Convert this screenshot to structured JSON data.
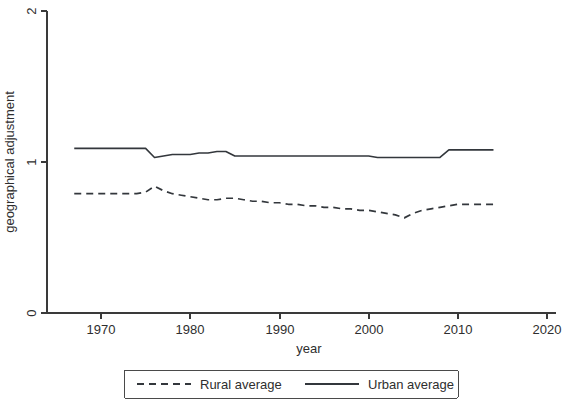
{
  "chart_data": {
    "type": "line",
    "title": "",
    "subtitle": "",
    "xlabel": "year",
    "ylabel": "geographical adjustment",
    "xlim": [
      1965,
      2020
    ],
    "ylim": [
      0,
      2
    ],
    "xticks": [
      1970,
      1980,
      1990,
      2000,
      2010,
      2020
    ],
    "xtick_labels": [
      "1970",
      "1980",
      "1990",
      "2000",
      "2010",
      "2020"
    ],
    "yticks": [
      0,
      1,
      2
    ],
    "ytick_labels": [
      "0",
      "1",
      "2"
    ],
    "grid": false,
    "legend_position": "bottom-center",
    "x": [
      1967,
      1968,
      1969,
      1970,
      1971,
      1972,
      1973,
      1974,
      1975,
      1976,
      1977,
      1978,
      1979,
      1980,
      1981,
      1982,
      1983,
      1984,
      1985,
      1986,
      1987,
      1988,
      1989,
      1990,
      1991,
      1992,
      1993,
      1994,
      1995,
      1996,
      1997,
      1998,
      1999,
      2000,
      2001,
      2002,
      2003,
      2004,
      2005,
      2006,
      2007,
      2008,
      2009,
      2010,
      2011,
      2012,
      2013,
      2014
    ],
    "series": [
      {
        "name": "Rural average",
        "style": "dashed",
        "color": "#33373c",
        "values": [
          0.79,
          0.79,
          0.79,
          0.79,
          0.79,
          0.79,
          0.79,
          0.79,
          0.8,
          0.84,
          0.81,
          0.79,
          0.78,
          0.77,
          0.76,
          0.75,
          0.75,
          0.76,
          0.76,
          0.75,
          0.74,
          0.74,
          0.73,
          0.73,
          0.72,
          0.72,
          0.71,
          0.71,
          0.7,
          0.7,
          0.69,
          0.69,
          0.68,
          0.68,
          0.67,
          0.66,
          0.65,
          0.63,
          0.66,
          0.68,
          0.69,
          0.7,
          0.71,
          0.72,
          0.72,
          0.72,
          0.72,
          0.72
        ]
      },
      {
        "name": "Urban average",
        "style": "solid",
        "color": "#33373c",
        "values": [
          1.09,
          1.09,
          1.09,
          1.09,
          1.09,
          1.09,
          1.09,
          1.09,
          1.09,
          1.03,
          1.04,
          1.05,
          1.05,
          1.05,
          1.06,
          1.06,
          1.07,
          1.07,
          1.04,
          1.04,
          1.04,
          1.04,
          1.04,
          1.04,
          1.04,
          1.04,
          1.04,
          1.04,
          1.04,
          1.04,
          1.04,
          1.04,
          1.04,
          1.04,
          1.03,
          1.03,
          1.03,
          1.03,
          1.03,
          1.03,
          1.03,
          1.03,
          1.08,
          1.08,
          1.08,
          1.08,
          1.08,
          1.08
        ]
      }
    ]
  },
  "legend": {
    "entries": [
      {
        "label": "Rural average",
        "style": "dashed"
      },
      {
        "label": "Urban average",
        "style": "solid"
      }
    ]
  }
}
